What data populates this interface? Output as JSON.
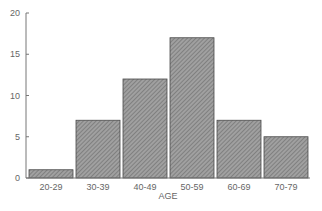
{
  "chart_data": {
    "type": "bar",
    "title": "",
    "xlabel": "AGE",
    "ylabel": "",
    "categories": [
      "20-29",
      "30-39",
      "40-49",
      "50-59",
      "60-69",
      "70-79"
    ],
    "values": [
      1,
      7,
      12,
      17,
      7,
      5
    ],
    "ylim": [
      0,
      20
    ],
    "yticks": [
      0,
      5,
      10,
      15,
      20
    ],
    "grid": false,
    "legend": null,
    "bar_fill": "hatched gray",
    "colors": {
      "bar": "#8c8c8c",
      "bar_edge": "#4a4a4a",
      "axis": "#777777"
    }
  }
}
